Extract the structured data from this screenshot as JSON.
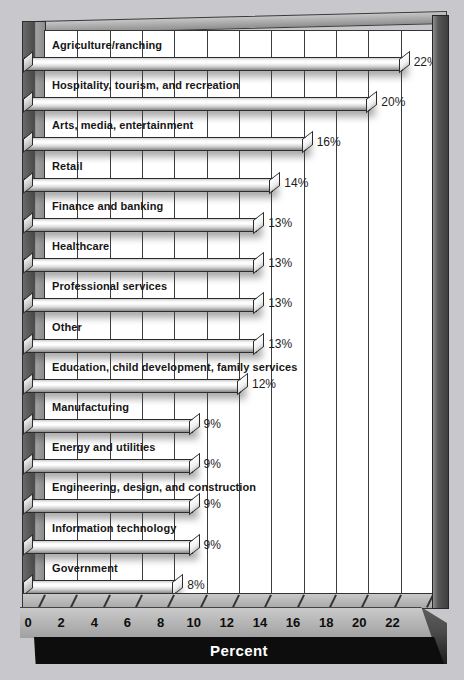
{
  "page": {
    "background_color": "#c8c8cc",
    "plot_background": "#ffffff",
    "frame_color": "#4b4b4b",
    "bar_outline": "#2c2c2c",
    "label_color": "#161616",
    "axis_band_color": "#b0b0b0",
    "percent_band_color": "#0d0d0d",
    "percent_text_color": "#ffffff"
  },
  "chart_data": {
    "type": "bar",
    "orientation": "horizontal",
    "title": "",
    "xlabel": "Percent",
    "ylabel": "",
    "xlim": [
      0,
      24
    ],
    "grid": true,
    "legend": false,
    "xticks": [
      "0",
      "2",
      "4",
      "6",
      "8",
      "10",
      "12",
      "14",
      "16",
      "18",
      "20",
      "22"
    ],
    "categories": [
      "Agriculture/ranching",
      "Hospitality, tourism, and recreation",
      "Arts, media, entertainment",
      "Retail",
      "Finance and banking",
      "Healthcare",
      "Professional services",
      "Other",
      "Education, child development, family services",
      "Manufacturing",
      "Energy and utilities",
      "Engineering, design, and construction",
      "Information technology",
      "Government"
    ],
    "values": [
      22,
      20,
      16,
      14,
      13,
      13,
      13,
      13,
      12,
      9,
      9,
      9,
      9,
      8
    ],
    "value_labels": [
      "22%",
      "20%",
      "16%",
      "14%",
      "13%",
      "13%",
      "13%",
      "13%",
      "12%",
      "9%",
      "9%",
      "9%",
      "9%",
      "8%"
    ]
  }
}
